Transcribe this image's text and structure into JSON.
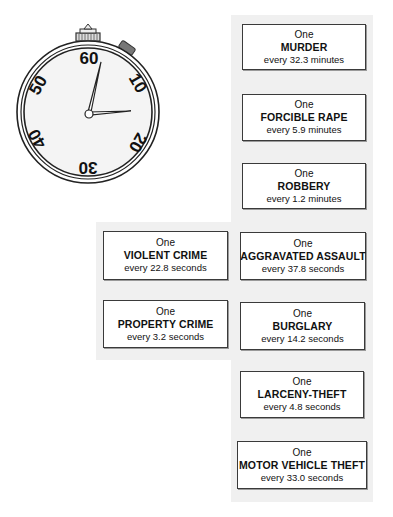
{
  "stopwatch": {
    "dial_numbers": [
      "60",
      "10",
      "20",
      "30",
      "40",
      "50"
    ],
    "icon": "stopwatch-icon"
  },
  "clock_boxes": [
    {
      "prefix": "One",
      "crime": "MURDER",
      "rate": "every 32.3 minutes"
    },
    {
      "prefix": "One",
      "crime": "FORCIBLE RAPE",
      "rate": "every 5.9 minutes"
    },
    {
      "prefix": "One",
      "crime": "ROBBERY",
      "rate": "every 1.2 minutes"
    },
    {
      "prefix": "One",
      "crime": "AGGRAVATED ASSAULT",
      "rate": "every 37.8 seconds"
    },
    {
      "prefix": "One",
      "crime": "BURGLARY",
      "rate": "every 14.2 seconds"
    },
    {
      "prefix": "One",
      "crime": "LARCENY-THEFT",
      "rate": "every 4.8 seconds"
    },
    {
      "prefix": "One",
      "crime": "MOTOR VEHICLE THEFT",
      "rate": "every 33.0 seconds"
    }
  ],
  "summary_boxes": [
    {
      "prefix": "One",
      "crime": "VIOLENT CRIME",
      "rate": "every 22.8 seconds"
    },
    {
      "prefix": "One",
      "crime": "PROPERTY CRIME",
      "rate": "every 3.2 seconds"
    }
  ],
  "colors": {
    "panel": "#f0f0f0",
    "border": "#3a3a3a",
    "text": "#111111"
  }
}
